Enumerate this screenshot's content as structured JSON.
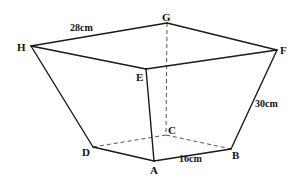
{
  "diagram": {
    "type": "frustum-square-truncated-pyramid",
    "vertices": {
      "A": {
        "label": "A",
        "x": 154,
        "y": 161,
        "lx": 150,
        "ly": 174
      },
      "B": {
        "label": "B",
        "x": 231,
        "y": 149,
        "lx": 232,
        "ly": 159
      },
      "C": {
        "label": "C",
        "x": 166,
        "y": 135,
        "lx": 168,
        "ly": 134
      },
      "D": {
        "label": "D",
        "x": 93,
        "y": 147,
        "lx": 82,
        "ly": 156
      },
      "E": {
        "label": "E",
        "x": 146,
        "y": 69,
        "lx": 136,
        "ly": 81
      },
      "F": {
        "label": "F",
        "x": 277,
        "y": 50,
        "lx": 280,
        "ly": 54
      },
      "G": {
        "label": "G",
        "x": 167,
        "y": 23,
        "lx": 162,
        "ly": 21
      },
      "H": {
        "label": "H",
        "x": 31,
        "y": 46,
        "lx": 17,
        "ly": 51
      }
    },
    "visible_edges": [
      [
        "H",
        "G"
      ],
      [
        "G",
        "F"
      ],
      [
        "F",
        "E"
      ],
      [
        "E",
        "H"
      ],
      [
        "H",
        "D"
      ],
      [
        "E",
        "A"
      ],
      [
        "F",
        "B"
      ],
      [
        "D",
        "A"
      ],
      [
        "A",
        "B"
      ]
    ],
    "hidden_edges": [
      [
        "G",
        "C"
      ],
      [
        "D",
        "C"
      ],
      [
        "C",
        "B"
      ]
    ],
    "dimensions": [
      {
        "id": "top_edge",
        "text": "28cm",
        "x": 70,
        "y": 31
      },
      {
        "id": "lateral_edge",
        "text": "30cm",
        "x": 255,
        "y": 107
      },
      {
        "id": "bottom_edge",
        "text": "16cm",
        "x": 179,
        "y": 162
      }
    ]
  }
}
